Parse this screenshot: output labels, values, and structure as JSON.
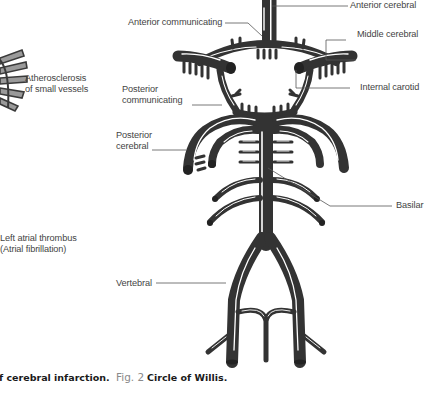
{
  "left_panel": {
    "labels": {
      "atherosclerosis_line1": "Atherosclerosis",
      "atherosclerosis_line2": "of small vessels",
      "thrombus_line1": "Left atrial thrombus",
      "thrombus_line2": "(Atrial fibrillation)"
    },
    "caption_fragment": "f cerebral infarction."
  },
  "figure": {
    "caption_number": "Fig. 2",
    "caption_title": "Circle of Willis.",
    "labels": {
      "anterior_cerebral": "Anterior cerebral",
      "anterior_communicating": "Anterior communicating",
      "middle_cerebral": "Middle cerebral",
      "internal_carotid": "Internal carotid",
      "posterior_communicating_line1": "Posterior",
      "posterior_communicating_line2": "communicating",
      "posterior_cerebral_line1": "Posterior",
      "posterior_cerebral_line2": "cerebral",
      "basilar": "Basilar",
      "vertebral": "Vertebral"
    },
    "colors": {
      "vessel": "#333333",
      "highlight": "#ffffff",
      "leader_line": "#555555"
    }
  }
}
